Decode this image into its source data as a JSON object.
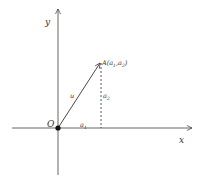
{
  "diagram": {
    "colors": {
      "axis": "#555555",
      "vector": "#333333",
      "dashed": "#444444",
      "text": "#333333",
      "origin_dot": "#111111"
    },
    "axes": {
      "x_label": "x",
      "y_label": "y",
      "origin_label": "O"
    },
    "point": {
      "name": "A",
      "label": "A(a",
      "sub1": "1",
      "comma": ",a",
      "sub2": "2",
      "close": ")"
    },
    "vector": {
      "label": "u"
    },
    "components": {
      "horizontal_label": "a",
      "horizontal_sub": "1",
      "vertical_label": "a",
      "vertical_sub": "2"
    }
  }
}
